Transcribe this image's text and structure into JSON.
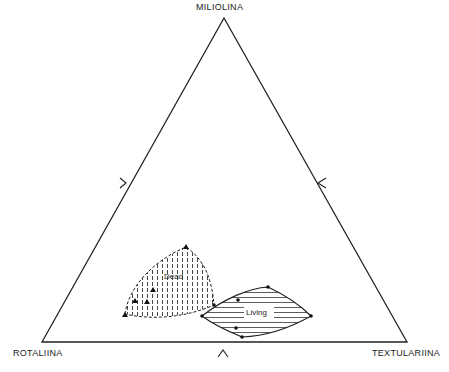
{
  "diagram": {
    "type": "ternary",
    "vertices": {
      "top": "MILIOLINA",
      "bottom_left": "ROTALIINA",
      "bottom_right": "TEXTULARIINA"
    },
    "fields": [
      {
        "name": "dead",
        "label": "Dead",
        "fill_pattern": "vertical-dashed"
      },
      {
        "name": "living",
        "label": "Living",
        "fill_pattern": "horizontal-lines"
      }
    ],
    "colors": {
      "line": "#222222",
      "background": "#ffffff"
    }
  }
}
